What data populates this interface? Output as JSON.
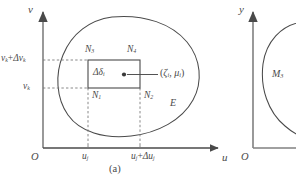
{
  "figure": {
    "caption": "(a)",
    "background_color": "#ffffff",
    "ink_color": "#4a4a4a",
    "panel_a": {
      "axes": {
        "origin_label": "O",
        "x_axis_label": "u",
        "y_axis_label": "v"
      },
      "y_ticks": [
        {
          "base": "v",
          "base_sub": "k",
          "plus": "+",
          "delta": "Δv",
          "delta_sub": "k",
          "has_delta": true
        },
        {
          "base": "v",
          "base_sub": "k",
          "plus": "",
          "delta": "",
          "delta_sub": "",
          "has_delta": false
        }
      ],
      "x_ticks": [
        {
          "base": "u",
          "base_sub": "j",
          "plus": "",
          "delta": "",
          "delta_sub": "",
          "has_delta": false
        },
        {
          "base": "u",
          "base_sub": "j",
          "plus": "+",
          "delta": "Δu",
          "delta_sub": "j",
          "has_delta": true
        }
      ],
      "region_label": "E",
      "cell_label": {
        "symbol": "Δδ",
        "subscript": "i"
      },
      "point_label": {
        "open": "(",
        "xi": "ζ",
        "xi_sub": "i",
        "comma": ",",
        "mu": "μ",
        "mu_sub": "i",
        "close": ")"
      },
      "corner_nodes": [
        {
          "symbol": "N",
          "subscript": "3",
          "position": "top-left"
        },
        {
          "symbol": "N",
          "subscript": "4",
          "position": "top-right"
        },
        {
          "symbol": "N",
          "subscript": "1",
          "position": "bottom-left"
        },
        {
          "symbol": "N",
          "subscript": "2",
          "position": "bottom-right"
        }
      ]
    },
    "panel_b": {
      "axes": {
        "origin_label": "O",
        "y_axis_label": "y"
      },
      "region_label": {
        "symbol": "M",
        "subscript": "3"
      }
    }
  }
}
